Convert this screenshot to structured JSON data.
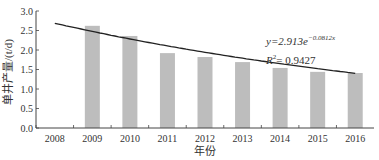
{
  "chart_data": {
    "type": "bar",
    "title": "",
    "xlabel": "年份",
    "ylabel": "单井产量/(t/d)",
    "categories": [
      "2008",
      "2009",
      "2010",
      "2011",
      "2012",
      "2013",
      "2014",
      "2015",
      "2016"
    ],
    "values": [
      null,
      2.62,
      2.36,
      1.92,
      1.82,
      1.69,
      1.54,
      1.44,
      1.41
    ],
    "ylim": [
      0,
      3.0
    ],
    "yticks": [
      "0.0",
      "0.5",
      "1.0",
      "1.5",
      "2.0",
      "2.5",
      "3.0"
    ],
    "trendline": {
      "type": "exponential",
      "a": 2.913,
      "b": -0.0812,
      "equation": "y=2.913e",
      "exponent": "−0.0812x",
      "r2_label": "R",
      "r2_value": "= 0.9427"
    },
    "bar_color": "#bdbdbd",
    "grid": false,
    "legend": "none"
  }
}
